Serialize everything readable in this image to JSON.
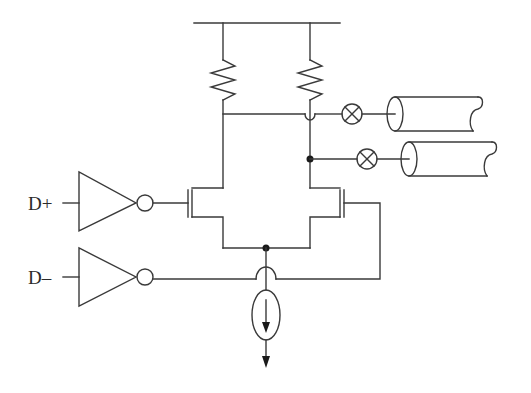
{
  "diagram": {
    "colors": {
      "wire": "#3a3a3a",
      "background": "#ffffff",
      "junction": "#1a1a1a"
    },
    "inputs": [
      {
        "id": "dplus",
        "label": "D+"
      },
      {
        "id": "dminus",
        "label": "D–"
      }
    ],
    "components": [
      {
        "type": "supply-rail"
      },
      {
        "type": "resistor",
        "name": "left-pull-up"
      },
      {
        "type": "resistor",
        "name": "right-pull-up"
      },
      {
        "type": "inverting-buffer",
        "input": "D+"
      },
      {
        "type": "inverting-buffer",
        "input": "D–"
      },
      {
        "type": "nmos-transistor",
        "name": "left"
      },
      {
        "type": "nmos-transistor",
        "name": "right"
      },
      {
        "type": "current-source",
        "direction": "down"
      },
      {
        "type": "lamp-symbol",
        "count": 2
      },
      {
        "type": "coax-cable",
        "count": 2
      }
    ]
  }
}
